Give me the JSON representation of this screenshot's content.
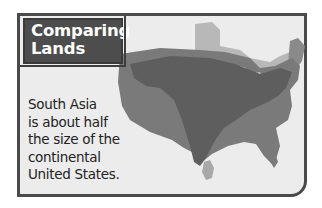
{
  "panel": {
    "title_line1": "Comparing",
    "title_line2": "Lands",
    "caption_lines": [
      "South Asia",
      "is about half",
      "the size of the",
      "continental",
      "United States."
    ]
  },
  "map": {
    "regions": [
      {
        "name": "Canada",
        "color": "#b5b5b5"
      },
      {
        "name": "Continental United States",
        "color": "#7a7a7a"
      },
      {
        "name": "South Asia",
        "color": "#5e5e5e"
      },
      {
        "name": "Sri Lanka",
        "color": "#a8a8a8"
      }
    ]
  },
  "colors": {
    "frame_border": "#4a4a4a",
    "title_bg": "#4d4d4d",
    "panel_bg": "#ececec"
  }
}
